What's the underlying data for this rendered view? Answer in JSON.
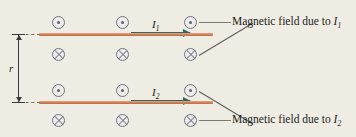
{
  "figure": {
    "background_color": "#efece3",
    "wire_color": "#cf7f55",
    "symbol_color": "#6f7392",
    "current_arrow_color": "#276b5e",
    "leader_color": "#7a7a7a"
  },
  "distance_label": "r",
  "currents": [
    {
      "label": "I",
      "subscript": "1"
    },
    {
      "label": "I",
      "subscript": "2"
    }
  ],
  "callouts": [
    {
      "text": "Magnetic field due to ",
      "symbol": "I",
      "subscript": "1"
    },
    {
      "text": "Magnetic field due to ",
      "symbol": "I",
      "subscript": "2"
    }
  ],
  "field_symbols": {
    "out_of_page_name": "dot-in-circle",
    "into_page_name": "cross-in-circle",
    "rows": [
      {
        "type": "out-of-page",
        "count": 3
      },
      {
        "type": "into-page",
        "count": 3
      },
      {
        "type": "out-of-page",
        "count": 3
      },
      {
        "type": "into-page",
        "count": 3
      }
    ]
  }
}
